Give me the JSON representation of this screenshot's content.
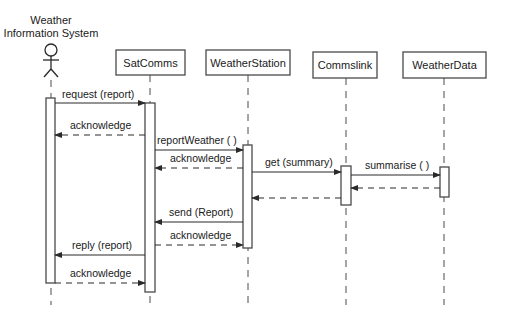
{
  "diagram": {
    "type": "UML sequence diagram",
    "actor": {
      "label_line1": "Weather",
      "label_line2": "Information System",
      "x": 51
    },
    "objects": [
      {
        "id": "satcomms",
        "label": "SatComms",
        "x": 150,
        "box": [
          116,
          50,
          69,
          25
        ]
      },
      {
        "id": "weatherstation",
        "label": "WeatherStation",
        "x": 248,
        "box": [
          206,
          50,
          84,
          25
        ]
      },
      {
        "id": "commslink",
        "label": "Commslink",
        "x": 346,
        "box": [
          313,
          52,
          64,
          26
        ]
      },
      {
        "id": "weatherdata",
        "label": "WeatherData",
        "x": 444,
        "box": [
          403,
          52,
          83,
          26
        ]
      }
    ],
    "activations": [
      {
        "lifeline": "actor",
        "x": 46,
        "y": 98,
        "w": 9,
        "h": 185
      },
      {
        "lifeline": "satcomms",
        "x": 145,
        "y": 103,
        "w": 10,
        "h": 189
      },
      {
        "lifeline": "weatherstation",
        "x": 243,
        "y": 145,
        "w": 9,
        "h": 103
      },
      {
        "lifeline": "commslink",
        "x": 341,
        "y": 166,
        "w": 10,
        "h": 39
      },
      {
        "lifeline": "weatherdata",
        "x": 440,
        "y": 167,
        "w": 9,
        "h": 30
      }
    ],
    "messages": [
      {
        "label": "request (report)",
        "from_x": 55,
        "to_x": 145,
        "y": 103,
        "style": "sync",
        "label_x": 62,
        "label_y": 98
      },
      {
        "label": "acknowledge",
        "from_x": 145,
        "to_x": 55,
        "y": 135,
        "style": "return",
        "label_x": 70,
        "label_y": 129
      },
      {
        "label": "reportWeather ( )",
        "from_x": 155,
        "to_x": 243,
        "y": 150,
        "style": "sync",
        "label_x": 157,
        "label_y": 144
      },
      {
        "label": "acknowledge",
        "from_x": 243,
        "to_x": 155,
        "y": 168,
        "style": "return",
        "label_x": 170,
        "label_y": 162
      },
      {
        "label": "get (summary)",
        "from_x": 252,
        "to_x": 341,
        "y": 172,
        "style": "sync",
        "label_x": 265,
        "label_y": 166
      },
      {
        "label": "summarise ( )",
        "from_x": 351,
        "to_x": 440,
        "y": 175,
        "style": "sync",
        "label_x": 365,
        "label_y": 169
      },
      {
        "label": "",
        "from_x": 440,
        "to_x": 351,
        "y": 188,
        "style": "return"
      },
      {
        "label": "",
        "from_x": 341,
        "to_x": 252,
        "y": 198,
        "style": "return"
      },
      {
        "label": "send (Report)",
        "from_x": 243,
        "to_x": 155,
        "y": 222,
        "style": "sync",
        "label_x": 169,
        "label_y": 216
      },
      {
        "label": "acknowledge",
        "from_x": 155,
        "to_x": 243,
        "y": 245,
        "style": "return",
        "label_x": 170,
        "label_y": 239
      },
      {
        "label": "reply (report)",
        "from_x": 145,
        "to_x": 55,
        "y": 255,
        "style": "sync",
        "label_x": 72,
        "label_y": 249
      },
      {
        "label": "acknowledge",
        "from_x": 55,
        "to_x": 145,
        "y": 283,
        "style": "return",
        "label_x": 70,
        "label_y": 277
      }
    ],
    "lifeline_end_y": 305
  },
  "colors": {
    "line": "#4a4a4a",
    "text": "#1a1a1a",
    "background": "#ffffff"
  }
}
